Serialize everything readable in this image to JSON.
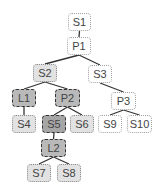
{
  "diagram": {
    "type": "tree",
    "styles": {
      "plain": {
        "fill": "#ffffff",
        "border": "#a0a0a0",
        "border_style": "dotted"
      },
      "light": {
        "fill": "#e2e2e2",
        "border": "#8a8a8a",
        "border_style": "dotted"
      },
      "medium": {
        "fill": "#b9b9b9",
        "border": "#333333",
        "border_style": "dashed"
      },
      "dark": {
        "fill": "#a6a6a6",
        "border": "#333333",
        "border_style": "dashed"
      }
    },
    "edge_color": "#333333",
    "nodes": [
      {
        "id": "S1",
        "label": "S1",
        "style": "plain",
        "x": 68,
        "y": 13,
        "w": 23,
        "h": 18
      },
      {
        "id": "P1",
        "label": "P1",
        "style": "plain",
        "x": 67,
        "y": 37,
        "w": 24,
        "h": 18
      },
      {
        "id": "S2",
        "label": "S2",
        "style": "light",
        "x": 33,
        "y": 64,
        "w": 24,
        "h": 18
      },
      {
        "id": "S3",
        "label": "S3",
        "style": "plain",
        "x": 88,
        "y": 65,
        "w": 24,
        "h": 18
      },
      {
        "id": "L1",
        "label": "L1",
        "style": "medium",
        "x": 12,
        "y": 89,
        "w": 24,
        "h": 18
      },
      {
        "id": "P2",
        "label": "P2",
        "style": "medium",
        "x": 55,
        "y": 89,
        "w": 25,
        "h": 18
      },
      {
        "id": "P3",
        "label": "P3",
        "style": "plain",
        "x": 111,
        "y": 92,
        "w": 25,
        "h": 18
      },
      {
        "id": "S4",
        "label": "S4",
        "style": "light",
        "x": 12,
        "y": 115,
        "w": 24,
        "h": 18
      },
      {
        "id": "S5",
        "label": "S5",
        "style": "dark",
        "x": 42,
        "y": 115,
        "w": 24,
        "h": 18
      },
      {
        "id": "S6",
        "label": "S6",
        "style": "light",
        "x": 70,
        "y": 115,
        "w": 24,
        "h": 18
      },
      {
        "id": "S9",
        "label": "S9",
        "style": "plain",
        "x": 98,
        "y": 115,
        "w": 24,
        "h": 18
      },
      {
        "id": "S10",
        "label": "S10",
        "style": "plain",
        "x": 127,
        "y": 115,
        "w": 25,
        "h": 18
      },
      {
        "id": "L2",
        "label": "L2",
        "style": "medium",
        "x": 41,
        "y": 139,
        "w": 25,
        "h": 18
      },
      {
        "id": "S7",
        "label": "S7",
        "style": "light",
        "x": 27,
        "y": 164,
        "w": 24,
        "h": 18
      },
      {
        "id": "S8",
        "label": "S8",
        "style": "light",
        "x": 57,
        "y": 164,
        "w": 24,
        "h": 18
      }
    ],
    "edges": [
      [
        "S1",
        "P1"
      ],
      [
        "P1",
        "S2"
      ],
      [
        "P1",
        "S3"
      ],
      [
        "S2",
        "L1"
      ],
      [
        "S2",
        "P2"
      ],
      [
        "S3",
        "P3"
      ],
      [
        "L1",
        "S4"
      ],
      [
        "P2",
        "S5"
      ],
      [
        "P2",
        "S6"
      ],
      [
        "P3",
        "S9"
      ],
      [
        "P3",
        "S10"
      ],
      [
        "S5",
        "L2"
      ],
      [
        "L2",
        "S7"
      ],
      [
        "L2",
        "S8"
      ]
    ]
  }
}
